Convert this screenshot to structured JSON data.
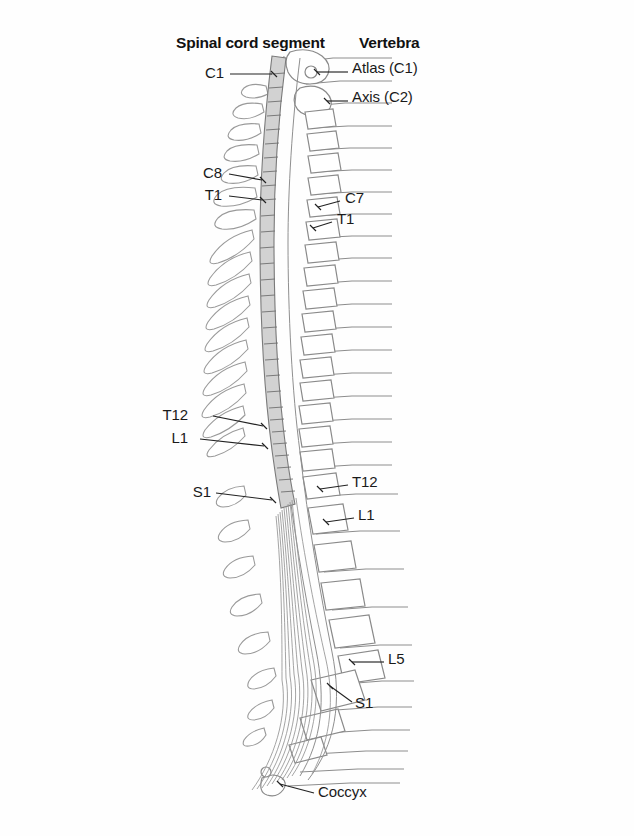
{
  "figure": {
    "title_left": "Spinal cord segment",
    "title_right": "Vertebra",
    "background_color": "#ffffff",
    "cord_fill_color": "#d2d2d2",
    "outline_color": "#8a8a8a",
    "label_color": "#1a1a1a"
  },
  "headers": {
    "left": "Spinal cord segment",
    "right": "Vertebra"
  },
  "cord_labels": [
    {
      "id": "cord-c1",
      "text": "C1",
      "x": 224,
      "y": 74,
      "anchor": "right"
    },
    {
      "id": "cord-c8",
      "text": "C8",
      "x": 222,
      "y": 174,
      "anchor": "right"
    },
    {
      "id": "cord-t1",
      "text": "T1",
      "x": 222,
      "y": 196,
      "anchor": "right"
    },
    {
      "id": "cord-t12",
      "text": "T12",
      "x": 188,
      "y": 416,
      "anchor": "right"
    },
    {
      "id": "cord-l1",
      "text": "L1",
      "x": 188,
      "y": 439,
      "anchor": "right"
    },
    {
      "id": "cord-s1",
      "text": "S1",
      "x": 211,
      "y": 493,
      "anchor": "right"
    }
  ],
  "vertebra_labels": [
    {
      "id": "vert-atlas",
      "text": "Atlas (C1)",
      "x": 352,
      "y": 69
    },
    {
      "id": "vert-axis",
      "text": "Axis (C2)",
      "x": 352,
      "y": 98
    },
    {
      "id": "vert-c7",
      "text": "C7",
      "x": 345,
      "y": 199
    },
    {
      "id": "vert-t1",
      "text": "T1",
      "x": 337,
      "y": 220
    },
    {
      "id": "vert-t12",
      "text": "T12",
      "x": 352,
      "y": 483
    },
    {
      "id": "vert-l1",
      "text": "L1",
      "x": 358,
      "y": 516
    },
    {
      "id": "vert-l5",
      "text": "L5",
      "x": 388,
      "y": 660
    },
    {
      "id": "vert-s1",
      "text": "S1",
      "x": 355,
      "y": 704
    },
    {
      "id": "vert-coccyx",
      "text": "Coccyx",
      "x": 318,
      "y": 793
    }
  ],
  "anatomy": {
    "region_names": [
      "cervical",
      "thoracic",
      "lumbar",
      "sacral",
      "coccygeal"
    ],
    "cord_segment_count": 31,
    "vertebra_count": 29,
    "cauda_equina_fiber_count": 9
  }
}
